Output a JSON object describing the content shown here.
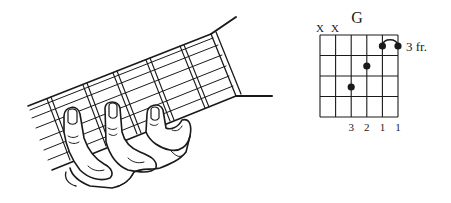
{
  "chord": {
    "name": "G",
    "position_label": "3 fr.",
    "string_markers": [
      "X",
      "X",
      "",
      "",
      "",
      ""
    ],
    "fingering": [
      "",
      "",
      "3",
      "2",
      "1",
      "1"
    ],
    "num_strings": 6,
    "num_frets": 4,
    "dots": [
      {
        "string": 3,
        "fret": 3,
        "finger": "3"
      },
      {
        "string": 4,
        "fret": 2,
        "finger": "2"
      },
      {
        "string": 5,
        "fret": 1,
        "finger": "1"
      },
      {
        "string": 6,
        "fret": 1,
        "finger": "1"
      }
    ],
    "barre": {
      "from_string": 5,
      "to_string": 6,
      "fret": 1
    }
  },
  "illustration": {
    "subject": "left hand fretting G chord on guitar neck"
  },
  "colors": {
    "ink": "#1a1a1a",
    "background": "#ffffff"
  }
}
